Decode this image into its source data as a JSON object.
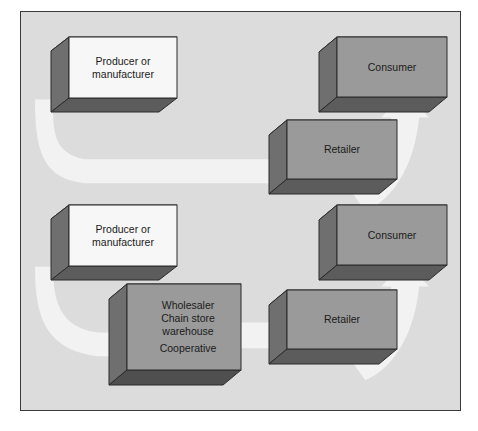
{
  "diagram": {
    "background_color": "#dcdcdc",
    "frame_border_color": "#3a3a3a",
    "arrow_color": "#f2f2f2",
    "box_face_light": "#f7f7f7",
    "box_face_gray": "#9a9a9a",
    "box_side_dark": "#6f6f6f",
    "box_bottom_dark": "#5c5c5c",
    "box_outline": "#2b2b2b",
    "channels": [
      {
        "name": "direct-to-retailer-channel",
        "nodes": [
          {
            "id": "producer-top",
            "label": "Producer or\nmanufacturer",
            "lines": [
              "Producer or",
              "manufacturer"
            ],
            "style": "light"
          },
          {
            "id": "retailer-top",
            "label": "Retailer",
            "lines": [
              "Retailer"
            ],
            "style": "gray"
          },
          {
            "id": "consumer-top",
            "label": "Consumer",
            "lines": [
              "Consumer"
            ],
            "style": "gray"
          }
        ],
        "flow": [
          "producer-top",
          "retailer-top",
          "consumer-top"
        ]
      },
      {
        "name": "wholesaler-channel",
        "nodes": [
          {
            "id": "producer-bottom",
            "label": "Producer or\nmanufacturer",
            "lines": [
              "Producer or",
              "manufacturer"
            ],
            "style": "light"
          },
          {
            "id": "wholesaler-bottom",
            "label": "Wholesaler\nChain store\nwarehouse\nCooperative",
            "lines": [
              "Wholesaler",
              "Chain store",
              "warehouse",
              "Cooperative"
            ],
            "style": "gray"
          },
          {
            "id": "retailer-bottom",
            "label": "Retailer",
            "lines": [
              "Retailer"
            ],
            "style": "gray"
          },
          {
            "id": "consumer-bottom",
            "label": "Consumer",
            "lines": [
              "Consumer"
            ],
            "style": "gray"
          }
        ],
        "flow": [
          "producer-bottom",
          "wholesaler-bottom",
          "retailer-bottom",
          "consumer-bottom"
        ]
      }
    ]
  }
}
